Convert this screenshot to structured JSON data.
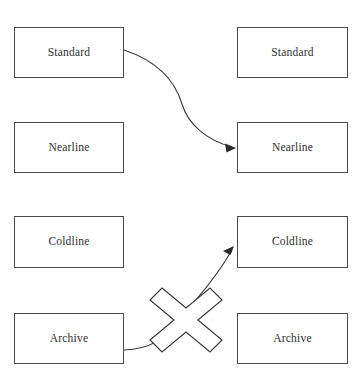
{
  "header": {
    "left_label": "",
    "right_label": ""
  },
  "diagram": {
    "type": "storage-class-transition",
    "columns": [
      {
        "id": "source",
        "title": ""
      },
      {
        "id": "destination",
        "title": ""
      }
    ],
    "source_nodes": [
      {
        "id": "source-standard",
        "label": "Standard"
      },
      {
        "id": "source-nearline",
        "label": "Nearline"
      },
      {
        "id": "source-coldline",
        "label": "Coldline"
      },
      {
        "id": "source-archive",
        "label": "Archive"
      }
    ],
    "destination_nodes": [
      {
        "id": "dest-standard",
        "label": "Standard"
      },
      {
        "id": "dest-nearline",
        "label": "Nearline"
      },
      {
        "id": "dest-coldline",
        "label": "Coldline"
      },
      {
        "id": "dest-archive",
        "label": "Archive"
      }
    ],
    "connectors": [
      {
        "id": "standard-to-nearline",
        "from": "source-standard",
        "to": "dest-nearline",
        "allowed": true,
        "marker": "arrow"
      },
      {
        "id": "archive-to-coldline",
        "from": "source-archive",
        "to": "dest-coldline",
        "allowed": false,
        "marker": "arrow",
        "blocked_glyph": "x-cross"
      }
    ],
    "colors": {
      "box_border": "#4a4a4a",
      "box_fill": "#ffffff",
      "text": "#2f2f2f",
      "connector": "#3a3a3a",
      "cross_outline": "#3a3a3a",
      "cross_fill": "#ffffff",
      "page_background": "#ffffff"
    }
  }
}
